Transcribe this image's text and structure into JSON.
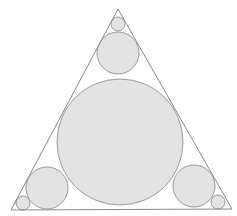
{
  "diagram": {
    "colors": {
      "background": "#ffffff",
      "stroke": "#8a8a8a",
      "circle_fill": "#e3e3e3",
      "circle_stroke": "#9a9a9a"
    },
    "triangle": {
      "apex": [
        118,
        9
      ],
      "left": [
        11,
        210
      ],
      "right": [
        232,
        209
      ]
    },
    "circles": [
      {
        "name": "incircle",
        "cx": 120,
        "cy": 142,
        "r": 63
      },
      {
        "name": "top-medium",
        "cx": 118,
        "cy": 53,
        "r": 21
      },
      {
        "name": "top-small",
        "cx": 118,
        "cy": 24,
        "r": 7
      },
      {
        "name": "bottom-left-medium",
        "cx": 47,
        "cy": 188,
        "r": 21
      },
      {
        "name": "bottom-left-small",
        "cx": 23,
        "cy": 203,
        "r": 7
      },
      {
        "name": "bottom-right-medium",
        "cx": 194,
        "cy": 186,
        "r": 21
      },
      {
        "name": "bottom-right-small",
        "cx": 218,
        "cy": 202,
        "r": 7
      }
    ]
  }
}
